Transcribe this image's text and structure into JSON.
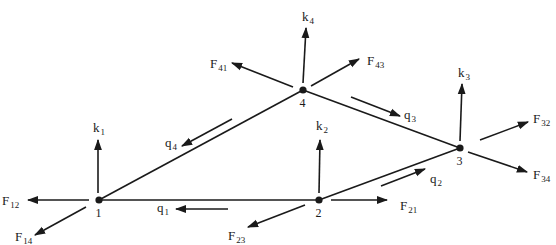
{
  "diagram": {
    "type": "network-flow-diagram",
    "ink_color": "#1a1a1a",
    "background": "#ffffff",
    "nodes": [
      {
        "id": "1",
        "label": "1",
        "x": 99,
        "y": 200
      },
      {
        "id": "2",
        "label": "2",
        "x": 319,
        "y": 200
      },
      {
        "id": "3",
        "label": "3",
        "x": 460,
        "y": 148
      },
      {
        "id": "4",
        "label": "4",
        "x": 303,
        "y": 90
      }
    ],
    "edges": [
      {
        "from": "1",
        "to": "2"
      },
      {
        "from": "2",
        "to": "3"
      },
      {
        "from": "3",
        "to": "4"
      },
      {
        "from": "4",
        "to": "1"
      }
    ],
    "flows": [
      {
        "name": "q",
        "sub": "1",
        "x1": 228,
        "y1": 209,
        "x2": 176,
        "y2": 209,
        "lx": 157,
        "ly": 212
      },
      {
        "name": "q",
        "sub": "2",
        "x1": 381,
        "y1": 186,
        "x2": 425,
        "y2": 169,
        "lx": 430,
        "ly": 183
      },
      {
        "name": "q",
        "sub": "3",
        "x1": 351,
        "y1": 97,
        "x2": 400,
        "y2": 116,
        "lx": 404,
        "ly": 119
      },
      {
        "name": "q",
        "sub": "4",
        "x1": 232,
        "y1": 119,
        "x2": 182,
        "y2": 146,
        "lx": 165,
        "ly": 147
      }
    ],
    "capacities": [
      {
        "name": "k",
        "sub": "1",
        "x1": 98,
        "y1": 193,
        "x2": 98,
        "y2": 140,
        "lx": 93,
        "ly": 132
      },
      {
        "name": "k",
        "sub": "2",
        "x1": 319,
        "y1": 193,
        "x2": 320,
        "y2": 140,
        "lx": 316,
        "ly": 130
      },
      {
        "name": "k",
        "sub": "3",
        "x1": 460,
        "y1": 141,
        "x2": 462,
        "y2": 84,
        "lx": 458,
        "ly": 77
      },
      {
        "name": "k",
        "sub": "4",
        "x1": 303,
        "y1": 83,
        "x2": 306,
        "y2": 28,
        "lx": 302,
        "ly": 21
      }
    ],
    "forces": [
      {
        "name": "F",
        "sub": "12",
        "x1": 89,
        "y1": 200,
        "x2": 28,
        "y2": 200,
        "lx": 2,
        "ly": 205
      },
      {
        "name": "F",
        "sub": "14",
        "x1": 86,
        "y1": 207,
        "x2": 35,
        "y2": 235,
        "lx": 15,
        "ly": 241
      },
      {
        "name": "F",
        "sub": "21",
        "x1": 331,
        "y1": 200,
        "x2": 387,
        "y2": 200,
        "lx": 400,
        "ly": 210
      },
      {
        "name": "F",
        "sub": "23",
        "x1": 305,
        "y1": 205,
        "x2": 248,
        "y2": 227,
        "lx": 228,
        "ly": 240
      },
      {
        "name": "F",
        "sub": "32",
        "x1": 480,
        "y1": 140,
        "x2": 528,
        "y2": 122,
        "lx": 533,
        "ly": 123
      },
      {
        "name": "F",
        "sub": "34",
        "x1": 468,
        "y1": 152,
        "x2": 527,
        "y2": 172,
        "lx": 533,
        "ly": 179
      },
      {
        "name": "F",
        "sub": "41",
        "x1": 293,
        "y1": 87,
        "x2": 232,
        "y2": 63,
        "lx": 210,
        "ly": 68
      },
      {
        "name": "F",
        "sub": "43",
        "x1": 311,
        "y1": 86,
        "x2": 359,
        "y2": 59,
        "lx": 367,
        "ly": 65
      }
    ]
  }
}
